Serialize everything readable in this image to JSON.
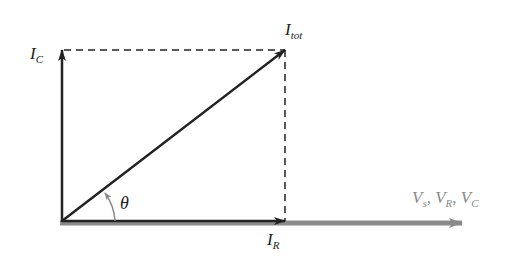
{
  "diagram": {
    "type": "phasor-diagram",
    "labels": {
      "ic_main": "I",
      "ic_sub": "C",
      "itot_main": "I",
      "itot_sub": "tot",
      "ir_main": "I",
      "ir_sub": "R",
      "theta": "θ",
      "v_vs": "V",
      "v_vs_sub": "s",
      "v_vr": "V",
      "v_vr_sub": "R",
      "v_vc": "V",
      "v_vc_sub": "C",
      "sep": ", "
    },
    "colors": {
      "phasor": "#222222",
      "voltage_axis": "#8a8a8a",
      "angle_arc": "#8a8a8a"
    },
    "geometry": {
      "origin": [
        62,
        221
      ],
      "ic_tip": [
        62,
        50
      ],
      "itot_tip": [
        285,
        50
      ],
      "ir_tip": [
        285,
        221
      ],
      "v_tip": [
        462,
        222
      ]
    }
  }
}
